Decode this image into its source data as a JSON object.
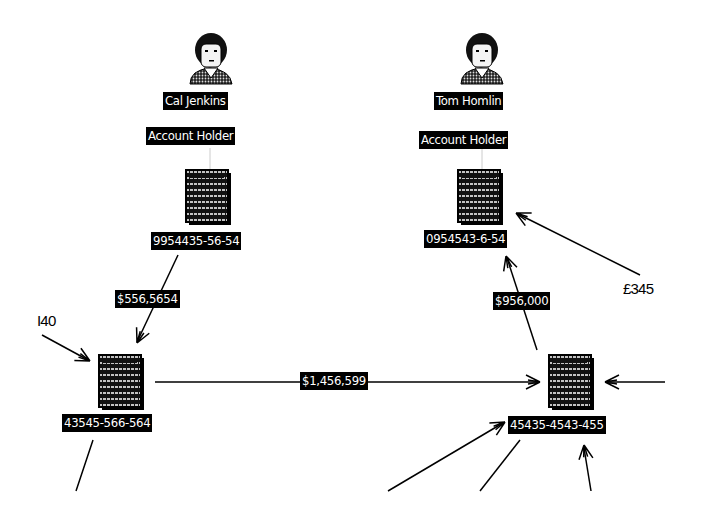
{
  "diagram": {
    "type": "link-analysis",
    "people": [
      {
        "id": "p1",
        "name": "Cal Jenkins",
        "role": "Account Holder",
        "icon": "person-icon"
      },
      {
        "id": "p2",
        "name": "Tom Homlin",
        "role": "Account Holder",
        "icon": "person-icon"
      }
    ],
    "accounts": [
      {
        "id": "a1",
        "number": "9954435-56-54",
        "icon": "ledger-document-icon"
      },
      {
        "id": "a2",
        "number": "0954543-6-54",
        "icon": "ledger-document-icon"
      },
      {
        "id": "a3",
        "number": "43545-566-564",
        "icon": "ledger-document-icon"
      },
      {
        "id": "a4",
        "number": "45435-4543-455",
        "icon": "ledger-document-icon"
      }
    ],
    "transfers": [
      {
        "from": "a1",
        "to": "a3",
        "amount": "$556,5654"
      },
      {
        "from": "a3",
        "to": "a4",
        "amount": "$1,456,599"
      },
      {
        "from": "a4",
        "to": "a2",
        "amount": "$956,000"
      },
      {
        "from": "external",
        "to": "a2",
        "amount": "£345"
      },
      {
        "from": "external",
        "to": "a3",
        "amount": "I40"
      }
    ],
    "links": [
      {
        "from": "p1",
        "to": "a1"
      },
      {
        "from": "p2",
        "to": "a2"
      }
    ]
  }
}
